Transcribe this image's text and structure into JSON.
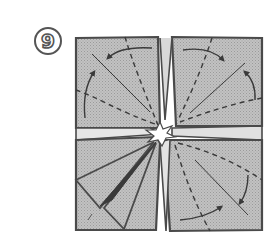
{
  "step": {
    "number": "9",
    "label": "⑨"
  },
  "colors": {
    "paper": "#b9b9b9",
    "outline": "#4a4a4a",
    "background": "#ffffff",
    "opening": "#ffffff"
  },
  "diagram": {
    "quadrants": [
      {
        "name": "top-left",
        "arrows": 2,
        "dashed_lines": 2,
        "solid_diagonal": true
      },
      {
        "name": "top-right",
        "arrows": 2,
        "dashed_lines": 2,
        "solid_diagonal": true
      },
      {
        "name": "bottom-left",
        "arrows": 0,
        "folded_point": true
      },
      {
        "name": "bottom-right",
        "arrows": 2,
        "dashed_lines": 2,
        "solid_diagonal": true
      }
    ]
  }
}
